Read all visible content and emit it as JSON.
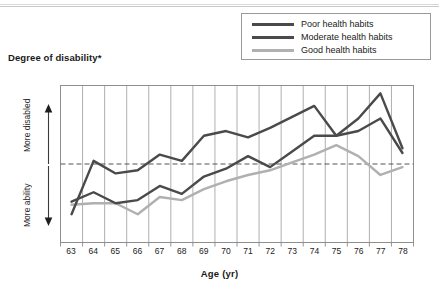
{
  "chart_data": {
    "type": "line",
    "title": "Degree of disability*",
    "xlabel": "Age (yr)",
    "ylabel": "Degree of disability*",
    "ylabel_top": "More disabled",
    "ylabel_bottom": "More ability",
    "x": [
      63,
      64,
      65,
      66,
      67,
      68,
      69,
      70,
      71,
      72,
      73,
      74,
      75,
      76,
      77,
      78
    ],
    "categories": [
      "63",
      "64",
      "65",
      "66",
      "67",
      "68",
      "69",
      "70",
      "71",
      "72",
      "73",
      "74",
      "75",
      "76",
      "77",
      "78"
    ],
    "ylim": [
      0,
      100
    ],
    "grid": "vertical",
    "legend_position": "top-right",
    "reference_line": {
      "style": "dashed",
      "value": 50
    },
    "series": [
      {
        "name": "Poor health habits",
        "color": "#4a4a4a",
        "values": [
          18,
          52,
          44,
          46,
          56,
          52,
          68,
          71,
          67,
          73,
          80,
          87,
          68,
          79,
          95,
          60
        ]
      },
      {
        "name": "Moderate health habits",
        "color": "#4a4a4a",
        "values": [
          26,
          32,
          25,
          27,
          36,
          31,
          42,
          47,
          55,
          48,
          58,
          68,
          68,
          71,
          79,
          57
        ]
      },
      {
        "name": "Good health habits",
        "color": "#b0b0b0",
        "values": [
          24,
          25,
          25,
          18,
          29,
          27,
          34,
          39,
          43,
          46,
          51,
          56,
          62,
          55,
          43,
          48
        ]
      }
    ]
  },
  "legend": {
    "items": [
      {
        "label": "Poor health habits",
        "color": "#4a4a4a"
      },
      {
        "label": "Moderate health habits",
        "color": "#4a4a4a"
      },
      {
        "label": "Good health habits",
        "color": "#b0b0b0"
      }
    ]
  },
  "axes": {
    "title": "Degree of disability*",
    "x_title": "Age (yr)",
    "y_top_caption": "More disabled",
    "y_bottom_caption": "More ability"
  },
  "colors": {
    "poor": "#4a4a4a",
    "moderate": "#4a4a4a",
    "good": "#b0b0b0",
    "grid": "#9a9a9a",
    "axis": "#8a8a8a",
    "dashed": "#555555"
  }
}
